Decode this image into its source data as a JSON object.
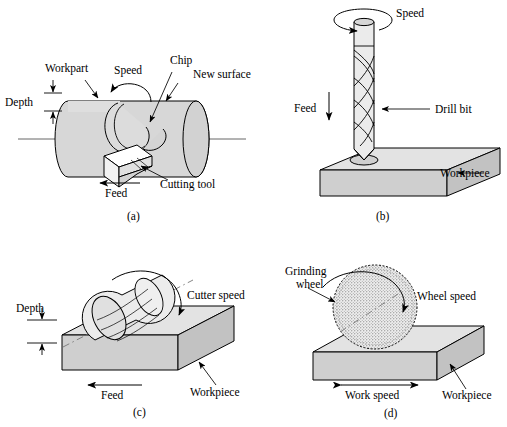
{
  "figure": {
    "colors": {
      "outline": "#000000",
      "body_fill": "#d7d7d7",
      "top_face_fill": "#e3e3e3",
      "front_face_fill": "#cfcfcf",
      "side_face_fill": "#c2c2c2",
      "tool_fill": "#ffffff",
      "wheel_fill": "#e8e8e8",
      "background": "#ffffff"
    }
  },
  "panels": [
    {
      "id": "a",
      "caption": "(a)",
      "process": "turning",
      "labels": {
        "workpart": "Workpart",
        "speed": "Speed",
        "chip": "Chip",
        "new_surface": "New surface",
        "depth": "Depth",
        "feed": "Feed",
        "cutting_tool": "Cutting tool"
      }
    },
    {
      "id": "b",
      "caption": "(b)",
      "process": "drilling",
      "labels": {
        "speed": "Speed",
        "drill_bit": "Drill bit",
        "feed": "Feed",
        "workpiece": "Workpiece"
      }
    },
    {
      "id": "c",
      "caption": "(c)",
      "process": "milling",
      "labels": {
        "cutter_speed": "Cutter speed",
        "depth": "Depth",
        "feed": "Feed",
        "workpiece": "Workpiece"
      }
    },
    {
      "id": "d",
      "caption": "(d)",
      "process": "grinding",
      "labels": {
        "grinding_wheel_line1": "Grinding",
        "grinding_wheel_line2": "wheel",
        "wheel_speed": "Wheel speed",
        "work_speed": "Work speed",
        "workpiece": "Workpiece"
      }
    }
  ]
}
